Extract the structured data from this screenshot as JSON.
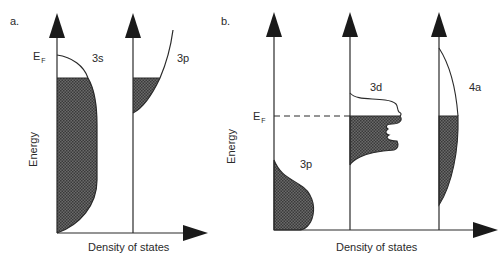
{
  "panels": {
    "a": {
      "label": "a.",
      "fermi": {
        "main": "E",
        "sub": "F"
      },
      "band_labels": [
        "3s",
        "3p"
      ],
      "ylabel": "Energy",
      "xlabel": "Density of states"
    },
    "b": {
      "label": "b.",
      "fermi": {
        "main": "E",
        "sub": "F"
      },
      "band_labels": [
        "3p",
        "3d",
        "4a"
      ],
      "ylabel": "Energy",
      "xlabel": "Density of states"
    }
  },
  "colors": {
    "line": "#2a2a2a",
    "fill": "#4a4a4a",
    "background": "#ffffff"
  }
}
